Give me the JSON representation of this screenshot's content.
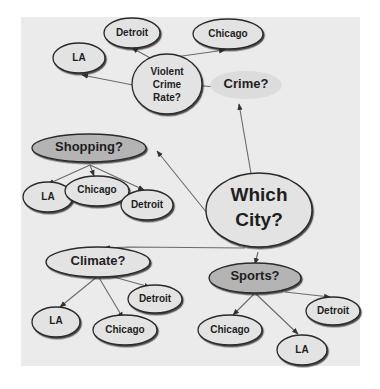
{
  "diagram": {
    "title": "Which City?",
    "root": {
      "id": "which-city",
      "label_line1": "Which",
      "label_line2": "City?"
    },
    "criteria": [
      {
        "id": "crime",
        "label": "Crime?",
        "sub": {
          "id": "violent-crime-rate",
          "line1": "Violent",
          "line2": "Crime",
          "line3": "Rate?"
        },
        "cities": [
          "Detroit",
          "Chicago",
          "LA"
        ]
      },
      {
        "id": "shopping",
        "label": "Shopping?",
        "cities": [
          "LA",
          "Chicago",
          "Detroit"
        ]
      },
      {
        "id": "climate",
        "label": "Climate?",
        "cities": [
          "LA",
          "Chicago",
          "Detroit"
        ]
      },
      {
        "id": "sports",
        "label": "Sports?",
        "cities": [
          "Chicago",
          "LA",
          "Detroit"
        ]
      }
    ],
    "colors": {
      "background": "#ebebeb",
      "node_fill": "#e3e3e3",
      "criterion_fill_dark": "#b4b4b4",
      "crime_fill": "#dcdcdc",
      "stroke": "#2a2a2a",
      "edge": "#6a6a6a"
    }
  }
}
